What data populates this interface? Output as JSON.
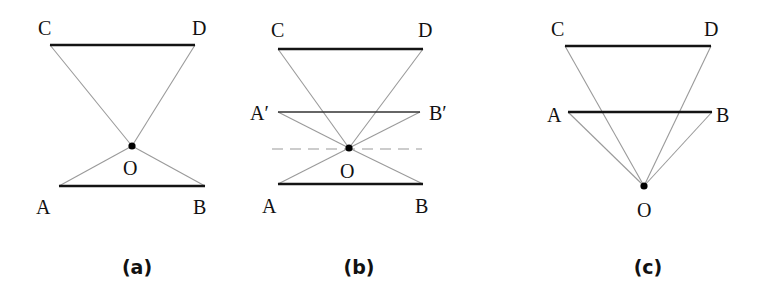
{
  "figure": {
    "panels": [
      {
        "id": "a",
        "caption": "(a)",
        "labels": {
          "C": "C",
          "D": "D",
          "O": "O",
          "A": "A",
          "B": "B"
        },
        "description": "Object AB below point O, image CD above; rays cross at O"
      },
      {
        "id": "b",
        "caption": "(b)",
        "labels": {
          "C": "C",
          "D": "D",
          "A_prime": "A′",
          "B_prime": "B′",
          "O": "O",
          "A": "A",
          "B": "B"
        },
        "description": "AB reflected about dashed line through O to A′B′; rays from O to CD and A′B′"
      },
      {
        "id": "c",
        "caption": "(c)",
        "labels": {
          "C": "C",
          "D": "D",
          "A": "A",
          "B": "B",
          "O": "O"
        },
        "description": "Point O below; AB and CD both above O, rays from O to endpoints"
      }
    ]
  },
  "colors": {
    "bar": "#141414",
    "ray": "#9a9a9a",
    "dot": "#000000",
    "background": "#ffffff"
  }
}
